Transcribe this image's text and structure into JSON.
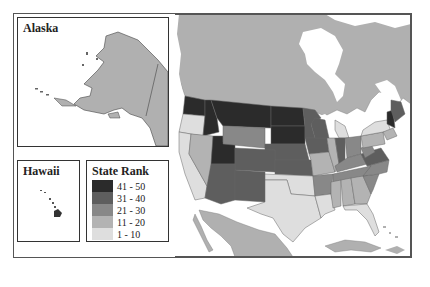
{
  "insets": {
    "alaska": {
      "title": "Alaska"
    },
    "hawaii": {
      "title": "Hawaii"
    }
  },
  "legend": {
    "title": "State Rank",
    "items": [
      {
        "label": "41 - 50",
        "color": "#2b2b2b"
      },
      {
        "label": "31 - 40",
        "color": "#5e5e5e"
      },
      {
        "label": "21 - 30",
        "color": "#888888"
      },
      {
        "label": "11 - 20",
        "color": "#b3b3b3"
      },
      {
        "label": "1 - 10",
        "color": "#dedede"
      }
    ]
  },
  "colors": {
    "land_other": "#b0b0b0",
    "water": "#ffffff",
    "border": "#555555"
  },
  "state_ranks": {
    "WA": "41 - 50",
    "OR": "1 - 10",
    "CA": "1 - 10",
    "ID": "41 - 50",
    "MT": "41 - 50",
    "NV": "11 - 20",
    "UT": "41 - 50",
    "WY": "21 - 30",
    "ND": "41 - 50",
    "SD": "41 - 50",
    "NE": "31 - 40",
    "CO": "31 - 40",
    "AZ": "31 - 40",
    "NM": "31 - 40",
    "KS": "31 - 40",
    "MN": "31 - 40",
    "IA": "31 - 40",
    "MO": "11 - 20",
    "OK": "1 - 10",
    "TX": "1 - 10",
    "WI": "31 - 40",
    "IL": "11 - 20",
    "MI": "1 - 10",
    "IN": "31 - 40",
    "OH": "21 - 30",
    "KY": "21 - 30",
    "TN": "21 - 30",
    "AR": "21 - 30",
    "LA": "1 - 10",
    "MS": "11 - 20",
    "AL": "11 - 20",
    "GA": "11 - 20",
    "FL": "1 - 10",
    "SC": "21 - 30",
    "NC": "21 - 30",
    "VA": "31 - 40",
    "WV": "21 - 30",
    "PA": "11 - 20",
    "NY": "1 - 10",
    "ME": "31 - 40",
    "NH": "41 - 50",
    "VT": "41 - 50",
    "NE_states": "11 - 20"
  }
}
